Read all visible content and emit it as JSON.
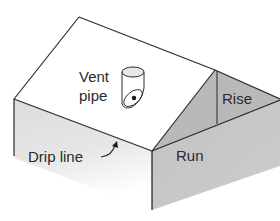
{
  "diagram": {
    "labels": {
      "vent_line1": "Vent",
      "vent_line2": "pipe",
      "rise": "Rise",
      "run": "Run",
      "drip_line": "Drip line"
    },
    "colors": {
      "outline": "#2b2b2b",
      "roof": "#ffffff",
      "left_wall": "#e2e2e2",
      "right_wall": "#c4c4c4",
      "gable": "#b9b9b9",
      "text": "#2a2a2a"
    }
  }
}
